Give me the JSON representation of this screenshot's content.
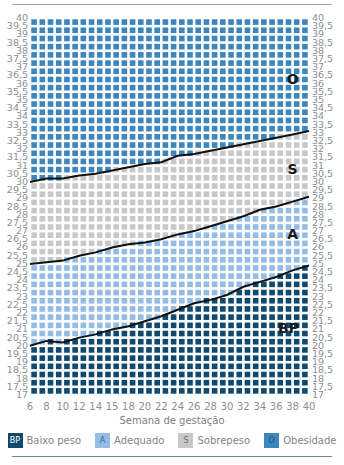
{
  "chart_data": {
    "type": "heatmap",
    "title": "",
    "xlabel": "Semana de gestação",
    "ylabel": "",
    "x_ticks": [
      "6",
      "8",
      "10",
      "12",
      "14",
      "15",
      "18",
      "20",
      "22",
      "24",
      "26",
      "28",
      "30",
      "32",
      "34",
      "36",
      "38",
      "40"
    ],
    "y_ticks": [
      "40",
      "39,5",
      "39",
      "38,5",
      "38",
      "37,5",
      "37",
      "36,5",
      "36",
      "35,5",
      "35",
      "34,5",
      "34",
      "33,5",
      "33",
      "32,5",
      "32",
      "31,5",
      "31",
      "30,5",
      "30",
      "29,5",
      "29",
      "28,5",
      "28",
      "27,5",
      "27",
      "26,5",
      "26",
      "25,5",
      "25",
      "24,5",
      "24",
      "23,5",
      "23",
      "22,5",
      "22",
      "21,5",
      "21",
      "20,5",
      "20",
      "19,5",
      "19",
      "18,5",
      "18",
      "17,5",
      "17"
    ],
    "xlim": [
      6,
      40
    ],
    "ylim": [
      17,
      40
    ],
    "grid": false,
    "legend_position": "bottom",
    "boundaries": [
      {
        "name": "O/S",
        "x": [
          6,
          8,
          10,
          12,
          14,
          16,
          18,
          20,
          22,
          24,
          26,
          28,
          30,
          32,
          34,
          36,
          38,
          40
        ],
        "y": [
          30.0,
          30.2,
          30.2,
          30.4,
          30.5,
          30.7,
          30.9,
          31.1,
          31.2,
          31.6,
          31.7,
          31.9,
          32.1,
          32.3,
          32.5,
          32.7,
          32.9,
          33.1
        ]
      },
      {
        "name": "S/A",
        "x": [
          6,
          8,
          10,
          12,
          14,
          16,
          18,
          20,
          22,
          24,
          26,
          28,
          30,
          32,
          34,
          36,
          38,
          40
        ],
        "y": [
          25.0,
          25.1,
          25.2,
          25.5,
          25.7,
          26.0,
          26.2,
          26.3,
          26.5,
          26.8,
          27.0,
          27.3,
          27.6,
          27.9,
          28.3,
          28.5,
          28.8,
          29.1
        ]
      },
      {
        "name": "A/BP",
        "x": [
          6,
          8,
          10,
          12,
          14,
          16,
          18,
          20,
          22,
          24,
          26,
          28,
          30,
          32,
          34,
          36,
          38,
          40
        ],
        "y": [
          20.0,
          20.3,
          20.2,
          20.5,
          20.7,
          21.0,
          21.2,
          21.5,
          21.8,
          22.2,
          22.6,
          22.8,
          23.1,
          23.6,
          23.9,
          24.2,
          24.6,
          24.9
        ]
      }
    ],
    "series": [
      {
        "name": "Baixo peso",
        "code": "BP",
        "region": "below A/BP"
      },
      {
        "name": "Adequado",
        "code": "A",
        "region": "between A/BP and S/A"
      },
      {
        "name": "Sobrepeso",
        "code": "S",
        "region": "between S/A and O/S"
      },
      {
        "name": "Obesidade",
        "code": "O",
        "region": "above O/S"
      }
    ],
    "zone_labels": [
      {
        "text": "O",
        "x": 38,
        "y": 36
      },
      {
        "text": "S",
        "x": 38,
        "y": 30.5
      },
      {
        "text": "A",
        "x": 38,
        "y": 26.5
      },
      {
        "text": "BP",
        "x": 37.5,
        "y": 20.8
      }
    ]
  },
  "colors": {
    "BP": "#0f4a6e",
    "A": "#93bde4",
    "S": "#c7c8ca",
    "O": "#3c85bd",
    "line": "#111111"
  },
  "legend": [
    {
      "code": "BP",
      "label": "Baixo peso",
      "color": "#0f4a6e",
      "text_color": "#ffffff"
    },
    {
      "code": "A",
      "label": "Adequado",
      "color": "#93bde4",
      "text_color": "#2e6c9e"
    },
    {
      "code": "S",
      "label": "Sobrepeso",
      "color": "#c7c8ca",
      "text_color": "#6b6e70"
    },
    {
      "code": "O",
      "label": "Obesidade",
      "color": "#3c85bd",
      "text_color": "#1d5a89"
    }
  ]
}
